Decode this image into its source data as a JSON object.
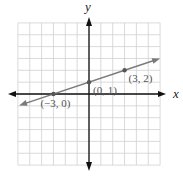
{
  "chart_data": {
    "type": "line",
    "title": "",
    "xlabel": "x",
    "ylabel": "y",
    "xlim": [
      -6,
      6
    ],
    "ylim": [
      -6,
      6
    ],
    "grid": true,
    "legend": null,
    "series": [
      {
        "name": "line",
        "x": [
          -3,
          0,
          3
        ],
        "y": [
          0,
          1,
          2
        ],
        "equation_implied": "y = (1/3)x + 1"
      }
    ],
    "points": [
      {
        "x": -3,
        "y": 0,
        "label": "(−3, 0)"
      },
      {
        "x": 0,
        "y": 1,
        "label": "(0, 1)"
      },
      {
        "x": 3,
        "y": 2,
        "label": "(3, 2)"
      }
    ]
  },
  "labels": {
    "x_axis": "x",
    "y_axis": "y"
  },
  "colors": {
    "grid": "#d0d0d0",
    "axes": "#111111",
    "line": "#7a7a7a",
    "points": "#555555",
    "text": "#555555"
  }
}
